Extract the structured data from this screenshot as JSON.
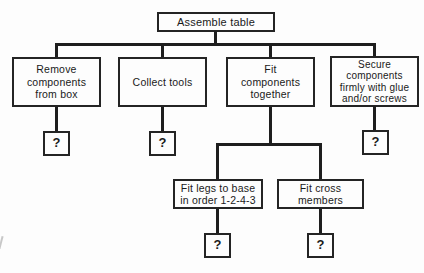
{
  "diagram": {
    "type": "hierarchical-task-flowchart",
    "placeholder": "?",
    "colors": {
      "line": "#1e1e1e",
      "border": "#242424",
      "background": "#fdfdfd",
      "text": "#1a1a1a"
    },
    "root": {
      "label": "Assemble table",
      "children": [
        {
          "id": "remove-components",
          "lines": [
            "Remove",
            "components",
            "from box"
          ],
          "placeholder_child": "?"
        },
        {
          "id": "collect-tools",
          "lines": [
            "Collect tools"
          ],
          "placeholder_child": "?"
        },
        {
          "id": "fit-components",
          "lines": [
            "Fit",
            "components",
            "together"
          ],
          "children": [
            {
              "id": "fit-legs",
              "lines": [
                "Fit legs to base",
                "in order 1-2-4-3"
              ],
              "placeholder_child": "?"
            },
            {
              "id": "fit-cross-members",
              "lines": [
                "Fit cross",
                "members"
              ],
              "placeholder_child": "?"
            }
          ]
        },
        {
          "id": "secure-components",
          "lines": [
            "Secure",
            "components",
            "firmly with glue",
            "and/or screws"
          ],
          "placeholder_child": "?"
        }
      ]
    }
  }
}
